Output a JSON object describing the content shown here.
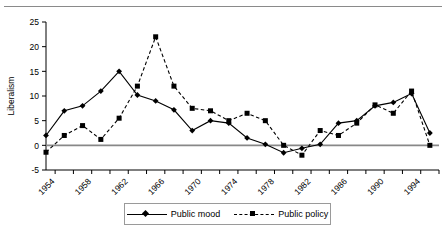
{
  "chart_data": {
    "type": "line",
    "title": "",
    "xlabel": "",
    "ylabel": "Liberalism",
    "xlim": [
      1953,
      1996
    ],
    "ylim": [
      -5,
      25
    ],
    "yticks": [
      -5,
      0,
      5,
      10,
      15,
      20,
      25
    ],
    "xticks": [
      1954,
      1956,
      1958,
      1960,
      1962,
      1964,
      1966,
      1968,
      1970,
      1972,
      1974,
      1976,
      1978,
      1980,
      1982,
      1984,
      1986,
      1988,
      1990,
      1992,
      1994,
      1996
    ],
    "xtick_labels": [
      "1954",
      "",
      "1958",
      "",
      "1962",
      "",
      "1966",
      "",
      "1970",
      "",
      "1974",
      "",
      "1978",
      "",
      "1982",
      "",
      "1986",
      "",
      "1990",
      "",
      "1994",
      ""
    ],
    "grid": false,
    "zero_line": true,
    "legend_position": "below-center",
    "x": [
      1953,
      1955,
      1957,
      1959,
      1961,
      1963,
      1965,
      1967,
      1969,
      1971,
      1973,
      1975,
      1977,
      1979,
      1981,
      1983,
      1985,
      1987,
      1989,
      1991,
      1993,
      1995
    ],
    "series": [
      {
        "name": "Public mood",
        "marker": "diamond",
        "linestyle": "solid",
        "color": "#000000",
        "values": [
          2.0,
          7.0,
          8.0,
          11.0,
          15.0,
          10.2,
          9.0,
          7.2,
          3.0,
          5.0,
          4.5,
          1.5,
          0.2,
          -1.5,
          -0.6,
          0.2,
          4.5,
          5.0,
          8.0,
          8.7,
          10.5,
          2.5
        ]
      },
      {
        "name": "Public policy",
        "marker": "square",
        "linestyle": "dashed",
        "color": "#000000",
        "values": [
          -1.4,
          2.0,
          4.0,
          1.2,
          5.5,
          12.0,
          22.0,
          12.0,
          7.5,
          7.0,
          5.0,
          6.5,
          5.0,
          0.0,
          -2.0,
          3.0,
          2.0,
          4.5,
          8.2,
          6.5,
          11.0,
          0.0
        ]
      }
    ]
  },
  "legend": {
    "entries": [
      {
        "label": "Public mood"
      },
      {
        "label": "Public policy"
      }
    ]
  },
  "axis": {
    "ylabel": "Liberalism"
  }
}
